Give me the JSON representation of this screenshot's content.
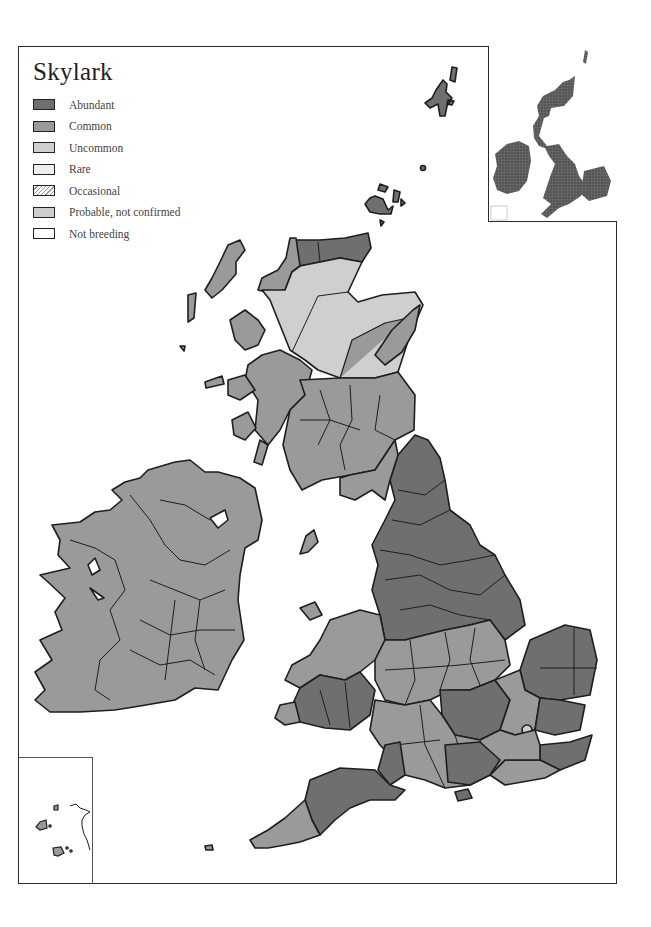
{
  "map": {
    "title": "Skylark",
    "legend": [
      {
        "label": "Abundant",
        "color": "#6f6f6f",
        "pattern": "solid"
      },
      {
        "label": "Common",
        "color": "#9a9a9a",
        "pattern": "solid"
      },
      {
        "label": "Uncommon",
        "color": "#cfcfcf",
        "pattern": "solid"
      },
      {
        "label": "Rare",
        "color": "#efefef",
        "pattern": "solid"
      },
      {
        "label": "Occasional",
        "color": "#ffffff",
        "pattern": "hatched"
      },
      {
        "label": "Probable, not confirmed",
        "color": "#cdcdcd",
        "pattern": "solid"
      },
      {
        "label": "Not breeding",
        "color": "#ffffff",
        "pattern": "solid"
      }
    ],
    "colors": {
      "abundant": "#6f6f6f",
      "common": "#9a9a9a",
      "uncommon": "#cfcfcf",
      "rare": "#efefef",
      "border": "#1e1e1e",
      "sea": "#ffffff"
    },
    "insets": {
      "overview": "British Isles grid overview",
      "channel_islands": "Channel Islands"
    }
  }
}
